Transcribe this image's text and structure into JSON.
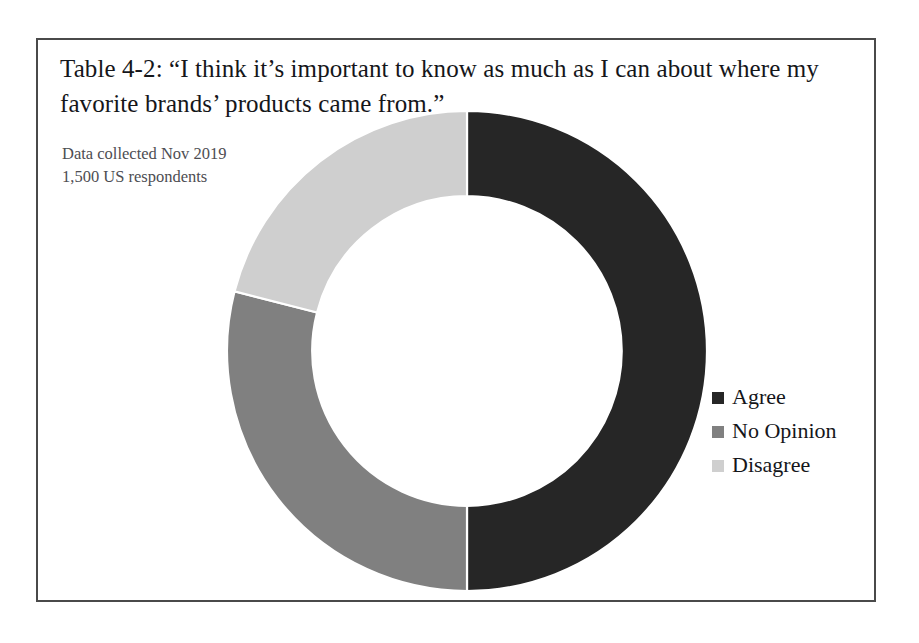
{
  "figure": {
    "frame_border_color": "#4a4a4a",
    "background_color": "#ffffff",
    "title": "Table 4-2: “I think it’s important to know as much as I can about where my favorite brands’ products came from.”",
    "annotation_line_1": "Data collected Nov 2019",
    "annotation_line_2": "1,500 US respondents"
  },
  "chart_data": {
    "type": "pie",
    "variant": "donut",
    "title": "Table 4-2: “I think it’s important to know as much as I can about where my favorite brands’ products came from.”",
    "subtitle": "Data collected Nov 2019 / 1,500 US respondents",
    "xlabel": "",
    "ylabel": "",
    "unit": "percent",
    "total_respondents": 1500,
    "start_angle_deg": 0,
    "direction": "clockwise",
    "inner_radius_ratio": 0.645,
    "data_labels_visible": false,
    "grid": false,
    "legend_position": "right",
    "categories": [
      "Agree",
      "No Opinion",
      "Disagree"
    ],
    "values": [
      50,
      29,
      21
    ],
    "colors": [
      "#262626",
      "#808080",
      "#cfcfcf"
    ],
    "slices": [
      {
        "label": "Agree",
        "value": 50,
        "color": "#262626",
        "start_deg": 0,
        "end_deg": 180
      },
      {
        "label": "No Opinion",
        "value": 29,
        "color": "#808080",
        "start_deg": 180,
        "end_deg": 284.4
      },
      {
        "label": "Disagree",
        "value": 21,
        "color": "#cfcfcf",
        "start_deg": 284.4,
        "end_deg": 360
      }
    ]
  },
  "legend": {
    "items": [
      {
        "label": "Agree",
        "color": "#262626"
      },
      {
        "label": "No Opinion",
        "color": "#808080"
      },
      {
        "label": "Disagree",
        "color": "#cfcfcf"
      }
    ]
  }
}
